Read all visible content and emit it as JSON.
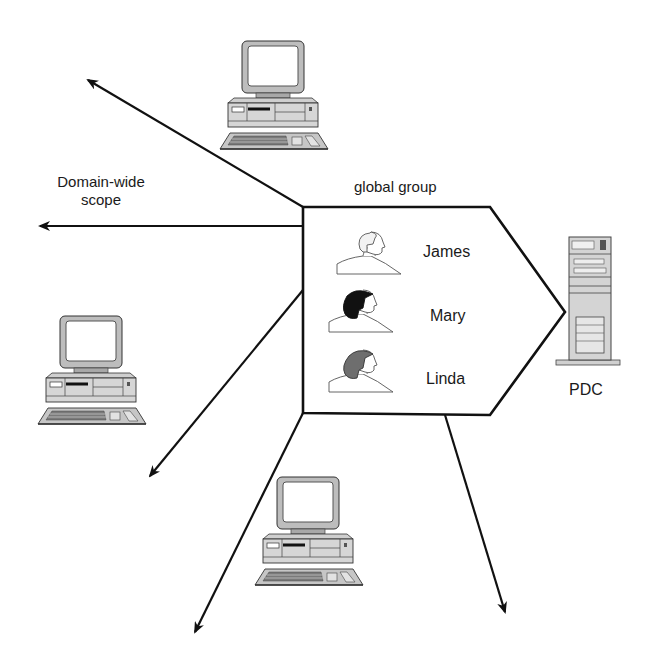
{
  "diagram": {
    "group": {
      "title": "global group",
      "members": [
        {
          "name": "James",
          "hair": "light",
          "hair_color": "#f2f2f2"
        },
        {
          "name": "Mary",
          "hair": "dark",
          "hair_color": "#111111"
        },
        {
          "name": "Linda",
          "hair": "gray",
          "hair_color": "#6e6e6e"
        }
      ]
    },
    "server": {
      "label": "PDC",
      "icon": "tower-server-icon"
    },
    "scope_label": {
      "line1": "Domain-wide",
      "line2": "scope"
    },
    "workstations": [
      {
        "id": "ws-top",
        "icon": "desktop-computer-icon"
      },
      {
        "id": "ws-left",
        "icon": "desktop-computer-icon"
      },
      {
        "id": "ws-bottom",
        "icon": "desktop-computer-icon"
      }
    ],
    "arrows": [
      {
        "id": "arrow-up-left",
        "direction": "up-left"
      },
      {
        "id": "arrow-left",
        "direction": "left"
      },
      {
        "id": "arrow-down-left",
        "direction": "down-left"
      },
      {
        "id": "arrow-down",
        "direction": "down-left-steep"
      },
      {
        "id": "arrow-down-right",
        "direction": "down-right"
      }
    ],
    "colors": {
      "line": "#111111",
      "fill": "#ffffff",
      "device_gray": "#c8c8c8"
    }
  }
}
